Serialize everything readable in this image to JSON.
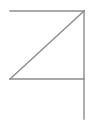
{
  "canvas": {
    "width": 91,
    "height": 131,
    "background_color": "#ffffff"
  },
  "figure": {
    "name": "flag-z-line-drawing",
    "stroke_color": "#8c8c8c",
    "stroke_width": 1.4,
    "segments": [
      {
        "name": "top-horizontal-line",
        "x1": 10,
        "y1": 11,
        "x2": 84,
        "y2": 11
      },
      {
        "name": "diagonal-line",
        "x1": 84,
        "y1": 11,
        "x2": 10,
        "y2": 79
      },
      {
        "name": "bottom-horizontal-line",
        "x1": 10,
        "y1": 79,
        "x2": 84,
        "y2": 79
      },
      {
        "name": "right-vertical-pole-line",
        "x1": 84,
        "y1": 11,
        "x2": 84,
        "y2": 119
      }
    ]
  }
}
